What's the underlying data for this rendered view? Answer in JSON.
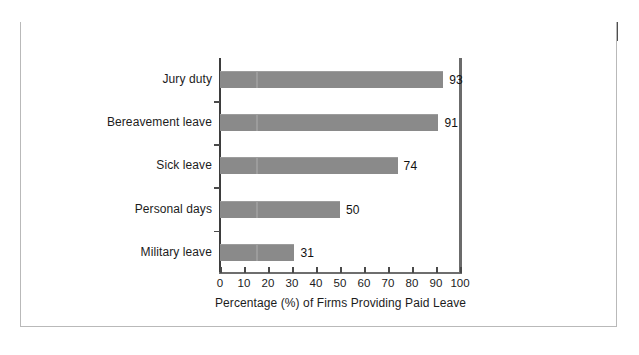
{
  "exhibit": {
    "tag": "EXHIBIT 12.12",
    "title": "Popular Off-the-Job Paid Leaves",
    "header_bg": "#4f4f4f",
    "tag_bg": "#111111"
  },
  "chart_data": {
    "type": "bar",
    "orientation": "horizontal",
    "title": "Popular Off-the-Job Paid Leaves",
    "categories": [
      "Jury duty",
      "Bereavement leave",
      "Sick leave",
      "Personal days",
      "Military leave"
    ],
    "values": [
      93,
      91,
      74,
      50,
      31
    ],
    "value_labels": [
      "93",
      "91",
      "74",
      "50",
      "31"
    ],
    "xlabel": "Percentage (%) of Firms Providing Paid Leave",
    "ylabel": "",
    "xlim": [
      0,
      100
    ],
    "xticks": [
      0,
      10,
      20,
      30,
      40,
      50,
      60,
      70,
      80,
      90,
      100
    ],
    "xtick_labels": [
      "0",
      "10",
      "20",
      "30",
      "40",
      "50",
      "60",
      "70",
      "80",
      "90",
      "100"
    ],
    "grid": false,
    "legend": "none",
    "bar_color": "#8a8a8a",
    "axis_color": "#4a4a4a",
    "background": "#ffffff"
  }
}
